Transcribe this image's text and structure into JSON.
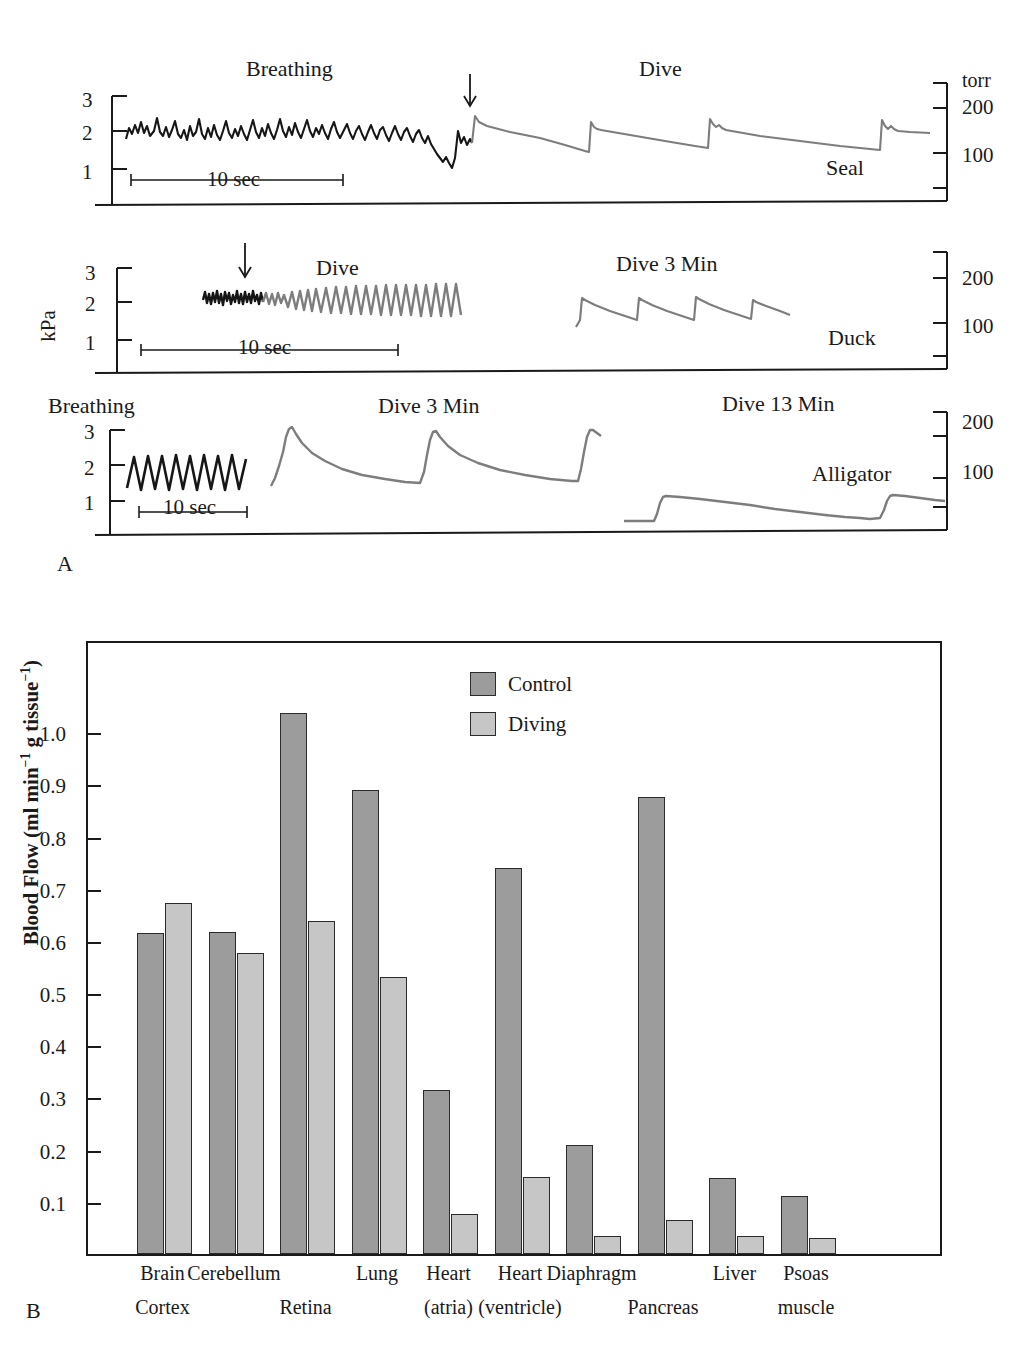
{
  "figure": {
    "panel_a_letter": "A",
    "panel_b_letter": "B"
  },
  "panel_a": {
    "y_axis_label": "kPa",
    "right_axis_unit": "torr",
    "y_ticks_kpa": [
      "3",
      "2",
      "1"
    ],
    "y_ticks_torr": [
      "200",
      "100"
    ],
    "scalebar_label": "10 sec",
    "traces": [
      {
        "species": "Seal",
        "annotations": [
          "Breathing",
          "Dive"
        ],
        "scalebar": "10 sec",
        "y_ticks": [
          "3",
          "2",
          "1"
        ],
        "right_ticks": [
          "torr",
          "200",
          "100"
        ],
        "arrow": "dive-onset-arrow"
      },
      {
        "species": "Duck",
        "annotations": [
          "Dive",
          "Dive 3 Min"
        ],
        "scalebar": "10 sec",
        "y_ticks": [
          "3",
          "2",
          "1"
        ],
        "right_ticks": [
          "200",
          "100"
        ],
        "arrow": "dive-onset-arrow"
      },
      {
        "species": "Alligator",
        "annotations": [
          "Breathing",
          "Dive 3 Min",
          "Dive 13 Min"
        ],
        "scalebar": "10 sec",
        "y_ticks": [
          "3",
          "2",
          "1"
        ],
        "right_ticks": [
          "200",
          "100"
        ],
        "arrow": null
      }
    ]
  },
  "chart_data": {
    "type": "bar",
    "title": "",
    "xlabel": "",
    "ylabel": "Blood Flow (ml min⁻¹ g tissue⁻¹)",
    "ylabel_parts": {
      "main": "Blood Flow (ml min",
      "sup1": "−1",
      "mid": " g tissue",
      "sup2": "−1",
      "end": ")"
    },
    "ylim": [
      0,
      1.1
    ],
    "ytick_values": [
      1.0,
      0.9,
      0.8,
      0.7,
      0.6,
      0.5,
      0.4,
      0.3,
      0.2,
      0.1
    ],
    "ytick_labels": [
      "1.0",
      "0.9",
      "0.8",
      "0.7",
      "0.6",
      "0.5",
      "0.4",
      "0.3",
      "0.2",
      "0.1"
    ],
    "grid": false,
    "legend_position": "top-center",
    "categories": [
      "Brain Cortex",
      "Cerebellum",
      "Retina",
      "Lung",
      "Heart (atria)",
      "Heart (ventricle)",
      "Diaphragm",
      "Pancreas",
      "Liver",
      "Psoas muscle"
    ],
    "category_label_lines": [
      [
        "Brain",
        "Cortex"
      ],
      [
        "Cerebellum",
        ""
      ],
      [
        "",
        "Retina"
      ],
      [
        "Lung",
        ""
      ],
      [
        "Heart",
        "(atria)"
      ],
      [
        "Heart",
        "(ventricle)"
      ],
      [
        "Diaphragm",
        ""
      ],
      [
        "",
        "Pancreas"
      ],
      [
        "Liver",
        ""
      ],
      [
        "Psoas",
        "muscle"
      ]
    ],
    "series": [
      {
        "name": "Control",
        "color": "#9c9c9c",
        "values": [
          0.615,
          0.617,
          1.037,
          0.889,
          0.315,
          0.739,
          0.209,
          0.876,
          0.146,
          0.112
        ]
      },
      {
        "name": "Diving",
        "color": "#c6c6c6",
        "values": [
          0.673,
          0.576,
          0.638,
          0.531,
          0.076,
          0.147,
          0.035,
          0.066,
          0.034,
          0.03
        ]
      }
    ]
  },
  "colors": {
    "control": "#9c9c9c",
    "diving": "#c6c6c6",
    "trace_breathing": "#161616",
    "trace_dive": "#7d7d7d",
    "axis": "#1a1a1a"
  }
}
